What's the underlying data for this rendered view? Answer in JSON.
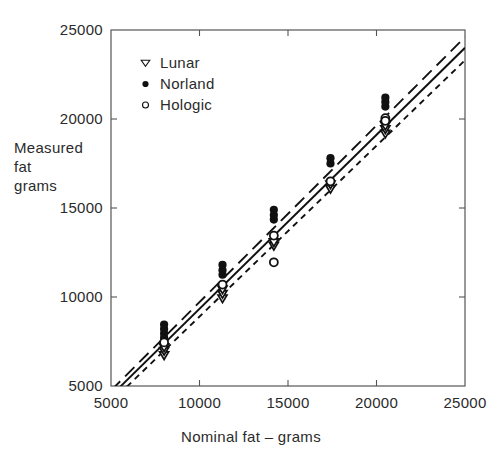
{
  "chart_data": {
    "type": "scatter",
    "title": "",
    "xlabel": "Nominal fat – grams",
    "ylabel": "Measured fat grams",
    "ylabel_lines": [
      "Measured",
      "fat",
      "grams"
    ],
    "xlim": [
      5000,
      25000
    ],
    "ylim": [
      5000,
      25000
    ],
    "xticks": [
      5000,
      10000,
      15000,
      20000,
      25000
    ],
    "yticks": [
      5000,
      10000,
      15000,
      20000,
      25000
    ],
    "xtick_labels": [
      "5000",
      "10000",
      "15000",
      "20000",
      "25000"
    ],
    "ytick_labels": [
      "5000",
      "10000",
      "15000",
      "20000",
      "25000"
    ],
    "grid": false,
    "tick_direction": "in",
    "frame": true,
    "legend_position": "upper-left-inside",
    "nominal_fat_levels": [
      8000,
      11300,
      14200,
      17400,
      20500
    ],
    "series": [
      {
        "name": "Lunar",
        "marker": "open-down-triangle",
        "color": "#111111",
        "line_style": "short-dash",
        "points": [
          {
            "x": 8000,
            "y": 6700
          },
          {
            "x": 8000,
            "y": 6950
          },
          {
            "x": 8000,
            "y": 7150
          },
          {
            "x": 11300,
            "y": 9900
          },
          {
            "x": 11300,
            "y": 10150
          },
          {
            "x": 11300,
            "y": 10400
          },
          {
            "x": 14200,
            "y": 12850
          },
          {
            "x": 14200,
            "y": 13050
          },
          {
            "x": 17400,
            "y": 16050
          },
          {
            "x": 17400,
            "y": 16300
          },
          {
            "x": 20500,
            "y": 19150
          },
          {
            "x": 20500,
            "y": 19400
          },
          {
            "x": 20500,
            "y": 19600
          }
        ],
        "fit_line": {
          "x1": 5000,
          "y1": 4100,
          "x2": 25000,
          "y2": 23300
        }
      },
      {
        "name": "Norland",
        "marker": "filled-circle",
        "color": "#111111",
        "line_style": "long-dash",
        "points": [
          {
            "x": 8000,
            "y": 7700
          },
          {
            "x": 8000,
            "y": 7950
          },
          {
            "x": 8000,
            "y": 8200
          },
          {
            "x": 8000,
            "y": 8450
          },
          {
            "x": 11300,
            "y": 11250
          },
          {
            "x": 11300,
            "y": 11500
          },
          {
            "x": 11300,
            "y": 11800
          },
          {
            "x": 14200,
            "y": 14350
          },
          {
            "x": 14200,
            "y": 14600
          },
          {
            "x": 14200,
            "y": 14900
          },
          {
            "x": 17400,
            "y": 17500
          },
          {
            "x": 17400,
            "y": 17800
          },
          {
            "x": 20500,
            "y": 20700
          },
          {
            "x": 20500,
            "y": 20950
          },
          {
            "x": 20500,
            "y": 21200
          }
        ],
        "fit_line": {
          "x1": 5000,
          "y1": 4750,
          "x2": 25000,
          "y2": 24600
        }
      },
      {
        "name": "Hologic",
        "marker": "open-circle",
        "color": "#111111",
        "line_style": "solid",
        "points": [
          {
            "x": 8000,
            "y": 7450
          },
          {
            "x": 11300,
            "y": 10700
          },
          {
            "x": 14200,
            "y": 11950
          },
          {
            "x": 14200,
            "y": 13450
          },
          {
            "x": 17400,
            "y": 16500
          },
          {
            "x": 20500,
            "y": 20050
          },
          {
            "x": 20500,
            "y": 19900
          }
        ],
        "fit_line": {
          "x1": 5000,
          "y1": 4450,
          "x2": 25000,
          "y2": 24000
        }
      }
    ],
    "legend_entries": [
      {
        "label": "Lunar",
        "marker": "open-down-triangle"
      },
      {
        "label": "Norland",
        "marker": "filled-circle"
      },
      {
        "label": "Hologic",
        "marker": "open-circle"
      }
    ]
  }
}
